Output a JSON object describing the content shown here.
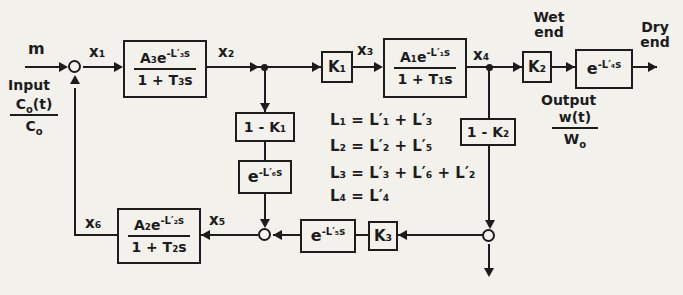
{
  "colors": {
    "ink": "#1c1c1c",
    "paper": "#f3f1ec"
  },
  "input": {
    "signal": "m",
    "caption": "Input",
    "frac_num_base": "C",
    "frac_num_sub": "o",
    "frac_num_rest": "(t)",
    "frac_den_base": "C",
    "frac_den_sub": "o"
  },
  "signals": {
    "x1": "x₁",
    "x2": "x₂",
    "x3": "x₃",
    "x4": "x₄",
    "x5": "x₅",
    "x6": "x₆"
  },
  "blocks": {
    "g3_num_base": "A₃e",
    "g3_exp": "-L′₃s",
    "g3_den": "1 + T₃s",
    "g1_num_base": "A₁e",
    "g1_exp": "-L′₁s",
    "g1_den": "1 + T₁s",
    "g2_num_base": "A₂e",
    "g2_exp": "-L′₂s",
    "g2_den": "1 + T₂s",
    "k1": "K₁",
    "k2": "K₂",
    "k3": "K₃",
    "one_minus_k1": "1 - K₁",
    "one_minus_k2": "1 - K₂",
    "d4_base": "e",
    "d4_exp": "-L′₄s",
    "d5_base": "e",
    "d5_exp": "-L′₅s",
    "d6_base": "e",
    "d6_exp": "-L′₆s"
  },
  "output": {
    "wet_end": "Wet\nend",
    "dry_end": "Dry\nend",
    "caption": "Output",
    "frac_num": "w(t)",
    "frac_den_base": "W",
    "frac_den_sub": "o"
  },
  "legend": {
    "l1": "L₁ = L′₁ + L′₃",
    "l2": "L₂ = L′₂ + L′₅",
    "l3": "L₃ = L′₃ + L′₆ + L′₂",
    "l4": "L₄ = L′₄"
  }
}
